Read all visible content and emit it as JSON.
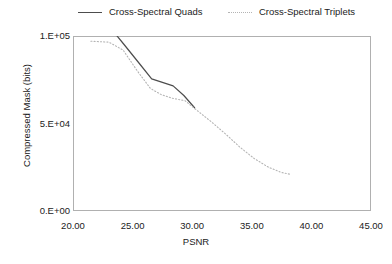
{
  "chart_data": {
    "type": "line",
    "title": "",
    "xlabel": "PSNR",
    "ylabel": "Compressed Mask (bits)",
    "xlim": [
      20.0,
      45.0
    ],
    "ylim": [
      0,
      100000
    ],
    "xticks": [
      "20.00",
      "25.00",
      "30.00",
      "35.00",
      "40.00",
      "45.00"
    ],
    "yticks": [
      "0.E+00",
      "5.E+04",
      "1.E+05"
    ],
    "grid": false,
    "legend_position": "top",
    "series": [
      {
        "name": "Cross-Spectral Quads",
        "style": "solid",
        "color": "#4d4d4d",
        "x": [
          21.9,
          23.4,
          24.3,
          25.6,
          26.6,
          27.5,
          28.4,
          29.3,
          30.2
        ],
        "y": [
          103000,
          102500,
          95000,
          84000,
          75500,
          73500,
          71500,
          66000,
          59000
        ]
      },
      {
        "name": "Cross-Spectral Triplets",
        "style": "dotted",
        "color": "#b4b4b4",
        "x": [
          21.5,
          23.0,
          24.2,
          25.4,
          26.5,
          27.4,
          28.3,
          29.4,
          30.4,
          31.6,
          32.8,
          34.0,
          35.2,
          36.4,
          37.5,
          38.2
        ],
        "y": [
          97000,
          96500,
          92000,
          80000,
          70000,
          66500,
          64500,
          63000,
          57500,
          51000,
          44000,
          36500,
          30000,
          25000,
          22000,
          21000
        ]
      }
    ]
  },
  "legend": {
    "quads": "Cross-Spectral Quads",
    "triplets": "Cross-Spectral Triplets",
    "quads_marker": "solid-line-swatch",
    "triplets_marker": "dotted-line-swatch"
  }
}
